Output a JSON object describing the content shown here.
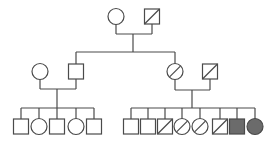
{
  "diagram": {
    "type": "pedigree",
    "legend": {
      "square": "male",
      "circle": "female",
      "slash": "marked (diagonal line)",
      "filled": "affected"
    },
    "generations": [
      {
        "id": "I",
        "individuals": [
          {
            "id": "I-1",
            "sex": "female",
            "marked": false,
            "affected": false
          },
          {
            "id": "I-2",
            "sex": "male",
            "marked": true,
            "affected": false
          }
        ],
        "couples": [
          {
            "partners": [
              "I-1",
              "I-2"
            ]
          }
        ]
      },
      {
        "id": "II",
        "individuals": [
          {
            "id": "II-1",
            "sex": "female",
            "marked": false,
            "affected": false,
            "married_in": true
          },
          {
            "id": "II-2",
            "sex": "male",
            "marked": false,
            "affected": false,
            "parents": [
              "I-1",
              "I-2"
            ]
          },
          {
            "id": "II-3",
            "sex": "female",
            "marked": true,
            "affected": false,
            "parents": [
              "I-1",
              "I-2"
            ]
          },
          {
            "id": "II-4",
            "sex": "male",
            "marked": true,
            "affected": false,
            "married_in": true
          }
        ],
        "couples": [
          {
            "partners": [
              "II-1",
              "II-2"
            ]
          },
          {
            "partners": [
              "II-3",
              "II-4"
            ]
          }
        ]
      },
      {
        "id": "III",
        "sibships": [
          {
            "parents": [
              "II-1",
              "II-2"
            ],
            "children": [
              {
                "id": "III-1",
                "sex": "male",
                "marked": false,
                "affected": false
              },
              {
                "id": "III-2",
                "sex": "female",
                "marked": false,
                "affected": false
              },
              {
                "id": "III-3",
                "sex": "male",
                "marked": false,
                "affected": false
              },
              {
                "id": "III-4",
                "sex": "female",
                "marked": false,
                "affected": false
              },
              {
                "id": "III-5",
                "sex": "male",
                "marked": false,
                "affected": false
              }
            ]
          },
          {
            "parents": [
              "II-3",
              "II-4"
            ],
            "children": [
              {
                "id": "III-6",
                "sex": "male",
                "marked": false,
                "affected": false
              },
              {
                "id": "III-7",
                "sex": "male",
                "marked": false,
                "affected": false
              },
              {
                "id": "III-8",
                "sex": "male",
                "marked": true,
                "affected": false
              },
              {
                "id": "III-9",
                "sex": "female",
                "marked": true,
                "affected": false
              },
              {
                "id": "III-10",
                "sex": "female",
                "marked": true,
                "affected": false
              },
              {
                "id": "III-11",
                "sex": "male",
                "marked": true,
                "affected": false
              },
              {
                "id": "III-12",
                "sex": "male",
                "marked": false,
                "affected": true
              },
              {
                "id": "III-13",
                "sex": "female",
                "marked": false,
                "affected": true
              }
            ]
          }
        ]
      }
    ],
    "colors": {
      "line": "#4a4a4a",
      "affected_fill": "#6b6b6b",
      "background": "#ffffff"
    }
  }
}
